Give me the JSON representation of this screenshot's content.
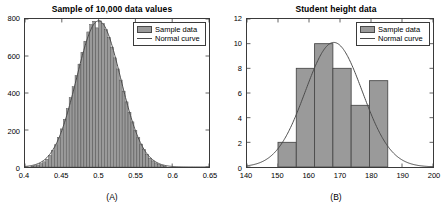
{
  "figure": {
    "background": "#ffffff",
    "bar_fill": "#9a9a9a",
    "bar_edge": "#4a4a4a",
    "curve_color": "#4a4a4a",
    "axis_color": "#3a3a3a"
  },
  "panelA": {
    "caption": "(A)",
    "legend": {
      "sample_label": "Sample data",
      "curve_label": "Normal curve"
    },
    "chart_data": {
      "type": "bar",
      "title": "Sample of 10,000 data values",
      "xlabel": "",
      "ylabel": "",
      "xlim": [
        0.4,
        0.65
      ],
      "ylim": [
        0,
        800
      ],
      "grid": false,
      "legend_position": "top-right",
      "xticks": [
        0.4,
        0.45,
        0.5,
        0.55,
        0.6,
        0.65
      ],
      "xtick_labels": [
        "0.4",
        "0.45",
        "0.5",
        "0.55",
        "0.6",
        "0.65"
      ],
      "yticks": [
        0,
        200,
        400,
        600,
        800
      ],
      "ytick_labels": [
        "0",
        "200",
        "400",
        "600",
        "800"
      ],
      "bin_width": 0.004,
      "bin_left_edges": [
        0.408,
        0.412,
        0.416,
        0.42,
        0.424,
        0.428,
        0.432,
        0.436,
        0.44,
        0.444,
        0.448,
        0.452,
        0.456,
        0.46,
        0.464,
        0.468,
        0.472,
        0.476,
        0.48,
        0.484,
        0.488,
        0.492,
        0.496,
        0.5,
        0.504,
        0.508,
        0.512,
        0.516,
        0.52,
        0.524,
        0.528,
        0.532,
        0.536,
        0.54,
        0.544,
        0.548,
        0.552,
        0.556,
        0.56,
        0.564,
        0.568,
        0.572,
        0.576,
        0.58,
        0.584,
        0.588
      ],
      "values": [
        4,
        7,
        11,
        18,
        28,
        42,
        62,
        88,
        120,
        160,
        206,
        258,
        316,
        375,
        434,
        494,
        556,
        620,
        680,
        730,
        770,
        788,
        752,
        790,
        775,
        742,
        700,
        648,
        590,
        530,
        470,
        410,
        352,
        296,
        244,
        198,
        158,
        124,
        94,
        68,
        48,
        33,
        22,
        14,
        9,
        5
      ],
      "overlay_curve": {
        "name": "Normal curve",
        "distribution": "normal",
        "mean": 0.5,
        "std": 0.03,
        "peak_value": 790
      },
      "sample_size": 10000
    }
  },
  "panelB": {
    "caption": "(B)",
    "legend": {
      "sample_label": "Sample data",
      "curve_label": "Normal curve"
    },
    "chart_data": {
      "type": "bar",
      "title": "Student height data",
      "xlabel": "",
      "ylabel": "",
      "xlim": [
        140,
        200
      ],
      "ylim": [
        0,
        12
      ],
      "grid": false,
      "legend_position": "top-right",
      "xticks": [
        140,
        150,
        160,
        170,
        180,
        190,
        200
      ],
      "xtick_labels": [
        "140",
        "150",
        "160",
        "170",
        "180",
        "190",
        "200"
      ],
      "yticks": [
        0,
        2,
        4,
        6,
        8,
        10,
        12
      ],
      "ytick_labels": [
        "0",
        "2",
        "4",
        "6",
        "8",
        "10",
        "12"
      ],
      "bin_edges": [
        150.0,
        155.9,
        161.8,
        167.7,
        173.6,
        179.5,
        185.4
      ],
      "categories": [
        "150-156",
        "156-162",
        "162-168",
        "168-174",
        "174-179",
        "179-185"
      ],
      "values": [
        2,
        8,
        10,
        8,
        5,
        7
      ],
      "overlay_curve": {
        "name": "Normal curve",
        "distribution": "normal",
        "mean": 168,
        "std": 9.2,
        "peak_value": 10.1
      }
    }
  }
}
